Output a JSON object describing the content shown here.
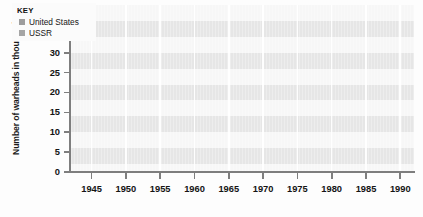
{
  "chart_data": {
    "type": "line",
    "title": "",
    "xlabel": "",
    "ylabel": "Number of warheads in thousands",
    "x": [
      1945,
      1950,
      1955,
      1960,
      1965,
      1970,
      1975,
      1980,
      1985,
      1990
    ],
    "xlim": [
      1942,
      1992
    ],
    "ylim": [
      0,
      42
    ],
    "ytick_values": [
      0,
      5,
      10,
      15,
      20,
      25,
      30,
      35,
      40
    ],
    "ytick_labels": [
      "0",
      "5",
      "10",
      "15",
      "20",
      "25",
      "30",
      "35",
      "40"
    ],
    "xtick_labels": [
      "1945",
      "1950",
      "1955",
      "1960",
      "1965",
      "1970",
      "1975",
      "1980",
      "1985",
      "1990"
    ],
    "grid": "horizontal-bands-and-vertical-lines",
    "legend_position": "top-left-inside",
    "series": [
      {
        "name": "United States",
        "color": "#9a9a9a",
        "values": [
          2,
          2,
          3,
          20,
          31,
          27,
          28,
          24,
          24,
          22
        ]
      },
      {
        "name": "USSR",
        "color": "#a8a8a8",
        "values": [
          0.3,
          0.4,
          0.5,
          0.5,
          6,
          11,
          19,
          30,
          39,
          38
        ]
      }
    ]
  },
  "axis": {
    "y_title": "Number of warheads in thousands",
    "y_labels": [
      "40",
      "35",
      "30",
      "25",
      "20",
      "15",
      "10",
      "5",
      "0"
    ],
    "x_labels": [
      "1945",
      "1950",
      "1955",
      "1960",
      "1965",
      "1970",
      "1975",
      "1980",
      "1985",
      "1990"
    ]
  },
  "legend": {
    "title": "KEY",
    "items": [
      {
        "label": "United States",
        "swatch": "#9d9d9d"
      },
      {
        "label": "USSR",
        "swatch": "#a5a5a5"
      }
    ]
  },
  "colors": {
    "plot_band_light": "#f7f7f7",
    "plot_band_dark": "#e6e6e6",
    "axis": "#7e7e7e",
    "us_line": "#9a9a9a",
    "ussr_line": "#a8a8a8"
  }
}
